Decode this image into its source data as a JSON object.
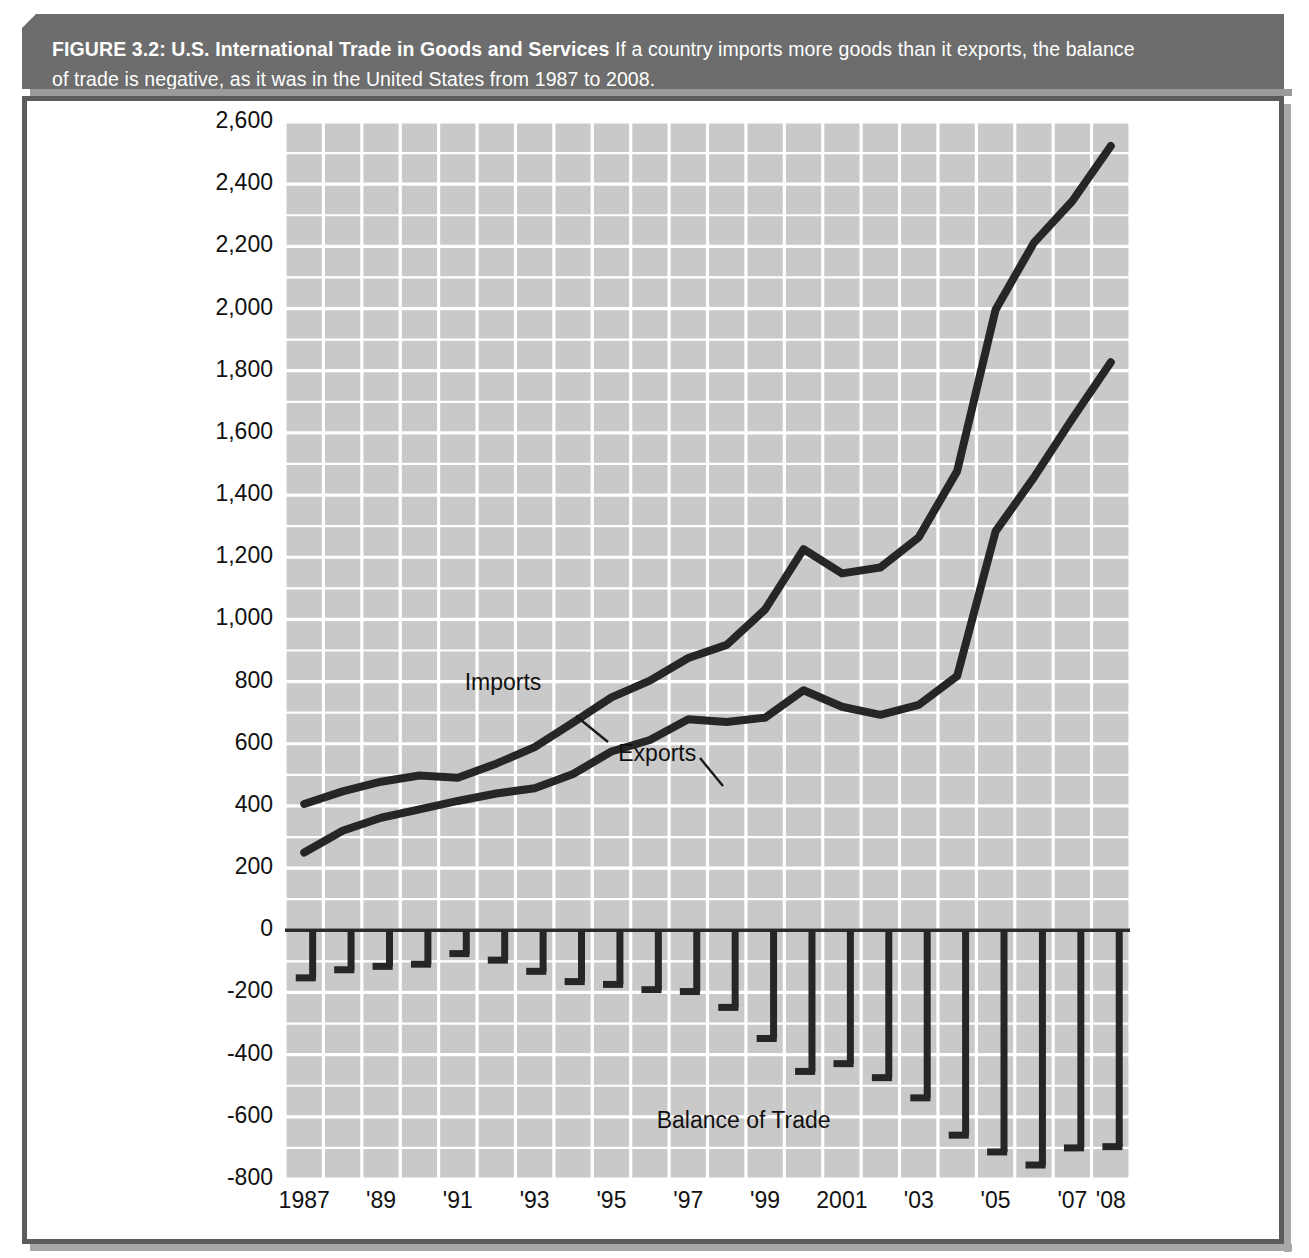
{
  "figure": {
    "title": "FIGURE 3.2: U.S. International Trade in Goods and Services",
    "caption": "If a country imports more goods than it exports, the balance of trade is negative, as it was in the United States from 1987 to 2008.",
    "banner_color": "#6d6d6d",
    "plot_background": "#c9c9c9",
    "gridline_color": "#ffffff",
    "series_color": "#262626"
  },
  "chart_data": {
    "type": "line",
    "title": "U.S. International Trade in Goods and Services",
    "xlabel": "",
    "ylabel": "Billions of dollars",
    "ylim": [
      -800,
      2600
    ],
    "ytick_step": 200,
    "grid": true,
    "legend_position": "inline-annotations",
    "x": [
      1987,
      1988,
      1989,
      1990,
      1991,
      1992,
      1993,
      1994,
      1995,
      1996,
      1997,
      1998,
      1999,
      2000,
      2001,
      2002,
      2003,
      2004,
      2005,
      2006,
      2007,
      2008
    ],
    "xtick_labels": [
      "1987",
      "'89",
      "'91",
      "'93",
      "'95",
      "'97",
      "'99",
      "2001",
      "'03",
      "'05",
      "'07",
      "'08"
    ],
    "xtick_values": [
      1987,
      1989,
      1991,
      1993,
      1995,
      1997,
      1999,
      2001,
      2003,
      2005,
      2007,
      2008
    ],
    "ytick_labels": [
      "2,600",
      "2,400",
      "2,200",
      "2,000",
      "1,800",
      "1,600",
      "1,400",
      "1,200",
      "1,000",
      "800",
      "600",
      "400",
      "200",
      "0",
      "-200",
      "-400",
      "-600",
      "-800"
    ],
    "ytick_values": [
      2600,
      2400,
      2200,
      2000,
      1800,
      1600,
      1400,
      1200,
      1000,
      800,
      600,
      400,
      200,
      0,
      -200,
      -400,
      -600,
      -800
    ],
    "series": [
      {
        "name": "Imports",
        "type": "line",
        "values": [
          406,
          447,
          478,
          498,
          491,
          536,
          589,
          668,
          749,
          803,
          876,
          918,
          1032,
          1226,
          1148,
          1167,
          1264,
          1477,
          1996,
          2212,
          2346,
          2523
        ]
      },
      {
        "name": "Exports",
        "type": "line",
        "values": [
          250,
          320,
          362,
          389,
          416,
          440,
          457,
          503,
          575,
          612,
          679,
          670,
          684,
          772,
          719,
          693,
          725,
          818,
          1283,
          1457,
          1646,
          1827
        ]
      },
      {
        "name": "Balance of Trade",
        "type": "bar",
        "values": [
          -153,
          -127,
          -116,
          -109,
          -75,
          -96,
          -132,
          -165,
          -174,
          -191,
          -197,
          -248,
          -348,
          -454,
          -429,
          -474,
          -539,
          -659,
          -713,
          -755,
          -700,
          -696
        ]
      }
    ],
    "annotations": [
      {
        "text": "Imports",
        "x": 1993,
        "y": 790
      },
      {
        "text": "Exports",
        "x": 1997,
        "y": 560
      },
      {
        "text": "Balance of Trade",
        "x": 1998,
        "y": -620
      }
    ]
  }
}
